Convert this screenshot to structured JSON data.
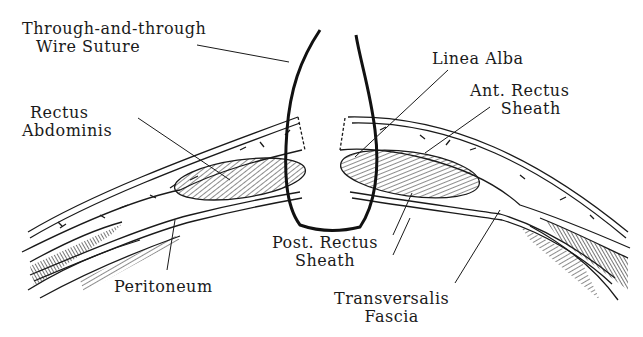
{
  "diagram": {
    "labels": {
      "suture_line1": "Through-and-through",
      "suture_line2": "Wire Suture",
      "rectus_line1": "Rectus",
      "rectus_line2": "Abdominis",
      "linea_alba": "Linea Alba",
      "ant_line1": "Ant. Rectus",
      "ant_line2": "Sheath",
      "post_line1": "Post. Rectus",
      "post_line2": "Sheath",
      "peritoneum": "Peritoneum",
      "transversalis_line1": "Transversalis",
      "transversalis_line2": "Fascia"
    },
    "colors": {
      "ink": "#1a1a1a",
      "background": "#ffffff"
    }
  }
}
